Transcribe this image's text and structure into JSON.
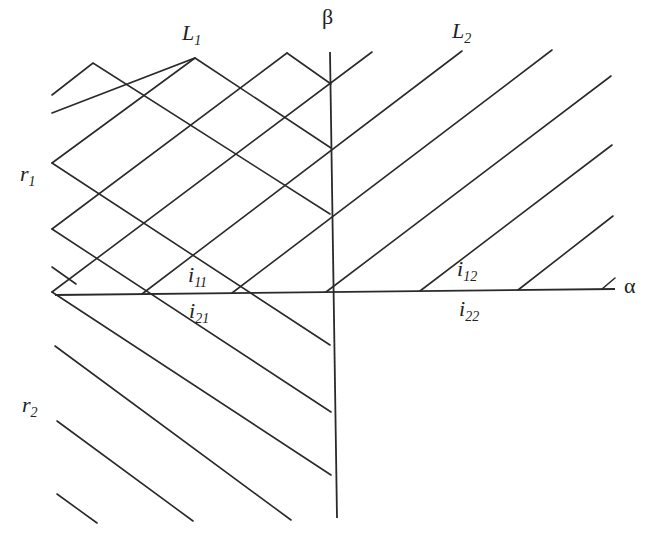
{
  "diagram": {
    "type": "line-crossing-diagram",
    "axes": {
      "horizontal": {
        "label": "α"
      },
      "vertical": {
        "label": "β"
      }
    },
    "labels": {
      "L1": {
        "main": "L",
        "sub": "1"
      },
      "L2": {
        "main": "L",
        "sub": "2"
      },
      "r1": {
        "main": "r",
        "sub": "1"
      },
      "r2": {
        "main": "r",
        "sub": "2"
      },
      "i11": {
        "main": "i",
        "sub": "11"
      },
      "i12": {
        "main": "i",
        "sub": "12"
      },
      "i21": {
        "main": "i",
        "sub": "21"
      },
      "i22": {
        "main": "i",
        "sub": "22"
      }
    },
    "line_color": "#2a2a2a",
    "background": "#ffffff"
  }
}
